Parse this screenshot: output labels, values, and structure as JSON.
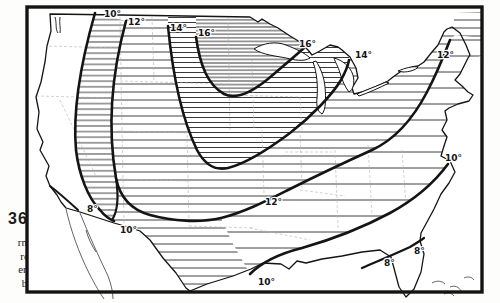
{
  "page": {
    "background": "#fdfdfb",
    "figure_number": "36",
    "caption_lines": [
      "rmal",
      "rom",
      "er to",
      "ber."
    ]
  },
  "map": {
    "kind": "isoline-map-of-united-states",
    "ink_color": "#141414",
    "hatch_color": "#2a2a2a",
    "state_line_color": "#b4b4b4",
    "frame_color": "#141414",
    "contour_values_shown": [
      "8°",
      "10°",
      "12°",
      "14°",
      "16°"
    ],
    "labels": [
      {
        "text": "10°",
        "x": 104,
        "y": 17
      },
      {
        "text": "12°",
        "x": 128,
        "y": 25
      },
      {
        "text": "14°",
        "x": 170,
        "y": 31
      },
      {
        "text": "16°",
        "x": 198,
        "y": 36
      },
      {
        "text": "16°",
        "x": 299,
        "y": 47
      },
      {
        "text": "14°",
        "x": 355,
        "y": 58
      },
      {
        "text": "12°",
        "x": 437,
        "y": 58
      },
      {
        "text": "10°",
        "x": 445,
        "y": 161
      },
      {
        "text": "12°",
        "x": 265,
        "y": 205
      },
      {
        "text": "10°",
        "x": 258,
        "y": 285
      },
      {
        "text": "8°",
        "x": 384,
        "y": 266
      },
      {
        "text": "8°",
        "x": 414,
        "y": 254
      },
      {
        "text": "8°",
        "x": 87,
        "y": 212
      },
      {
        "text": "10°",
        "x": 120,
        "y": 233
      }
    ]
  }
}
